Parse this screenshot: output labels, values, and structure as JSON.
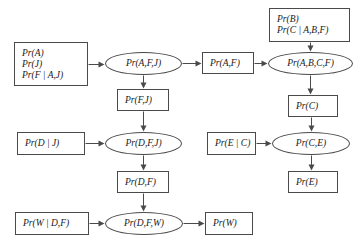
{
  "diagram": {
    "type": "flow-diagram",
    "stroke_color": "#4a4a4a",
    "text_color": "#1a1a1a",
    "background": "#ffffff",
    "nodes": [
      {
        "id": "n_prior_afj",
        "shape": "box",
        "lines": [
          "Pr(A)",
          "Pr(J)",
          "Pr(F | A,J)"
        ],
        "x": 14,
        "y": 42,
        "w": 74,
        "h": 44
      },
      {
        "id": "n_afj",
        "shape": "ellipse",
        "lines": [
          "Pr(A,F,J)"
        ],
        "x": 105,
        "y": 52,
        "w": 77,
        "h": 23
      },
      {
        "id": "n_fj",
        "shape": "box",
        "lines": [
          "Pr(F,J)"
        ],
        "x": 117,
        "y": 89,
        "w": 52,
        "h": 22
      },
      {
        "id": "n_af",
        "shape": "box",
        "lines": [
          "Pr(A,F)"
        ],
        "x": 202,
        "y": 52,
        "w": 52,
        "h": 22
      },
      {
        "id": "n_prior_b",
        "shape": "box",
        "lines": [
          "Pr(B)",
          "Pr(C | A,B,F)"
        ],
        "x": 269,
        "y": 8,
        "w": 81,
        "h": 34
      },
      {
        "id": "n_abcf",
        "shape": "ellipse",
        "lines": [
          "Pr(A,B,C,F)"
        ],
        "x": 268,
        "y": 52,
        "w": 85,
        "h": 23
      },
      {
        "id": "n_c",
        "shape": "box",
        "lines": [
          "Pr(C)"
        ],
        "x": 288,
        "y": 95,
        "w": 50,
        "h": 22
      },
      {
        "id": "n_prior_dj",
        "shape": "box",
        "lines": [
          "Pr(D | J)"
        ],
        "x": 17,
        "y": 132,
        "w": 68,
        "h": 23
      },
      {
        "id": "n_dfj",
        "shape": "ellipse",
        "lines": [
          "Pr(D,F,J)"
        ],
        "x": 105,
        "y": 132,
        "w": 77,
        "h": 23
      },
      {
        "id": "n_prior_ec",
        "shape": "box",
        "lines": [
          "Pr(E | C)"
        ],
        "x": 207,
        "y": 132,
        "w": 49,
        "h": 23
      },
      {
        "id": "n_ce",
        "shape": "ellipse",
        "lines": [
          "Pr(C,E)"
        ],
        "x": 272,
        "y": 132,
        "w": 78,
        "h": 23
      },
      {
        "id": "n_df",
        "shape": "box",
        "lines": [
          "Pr(D,F)"
        ],
        "x": 117,
        "y": 171,
        "w": 52,
        "h": 22
      },
      {
        "id": "n_e",
        "shape": "box",
        "lines": [
          "Pr(E)"
        ],
        "x": 288,
        "y": 171,
        "w": 50,
        "h": 22
      },
      {
        "id": "n_prior_wdf",
        "shape": "box",
        "lines": [
          "Pr(W | D,F)"
        ],
        "x": 15,
        "y": 212,
        "w": 74,
        "h": 23
      },
      {
        "id": "n_dfw",
        "shape": "ellipse",
        "lines": [
          "Pr(D,F,W)"
        ],
        "x": 105,
        "y": 212,
        "w": 78,
        "h": 23
      },
      {
        "id": "n_w",
        "shape": "box",
        "lines": [
          "Pr(W)"
        ],
        "x": 205,
        "y": 212,
        "w": 48,
        "h": 23
      }
    ],
    "edges": [
      {
        "from": "n_prior_afj",
        "to": "n_afj",
        "x1": 88,
        "y1": 64,
        "x2": 104,
        "y2": 64,
        "dir": "right"
      },
      {
        "from": "n_afj",
        "to": "n_fj",
        "x1": 143,
        "y1": 75,
        "x2": 143,
        "y2": 88,
        "dir": "down"
      },
      {
        "from": "n_afj",
        "to": "n_af",
        "x1": 182,
        "y1": 63,
        "x2": 201,
        "y2": 63,
        "dir": "right"
      },
      {
        "from": "n_af",
        "to": "n_abcf",
        "x1": 254,
        "y1": 63,
        "x2": 267,
        "y2": 63,
        "dir": "right"
      },
      {
        "from": "n_prior_b",
        "to": "n_abcf",
        "x1": 310,
        "y1": 42,
        "x2": 310,
        "y2": 51,
        "dir": "down"
      },
      {
        "from": "n_abcf",
        "to": "n_c",
        "x1": 310,
        "y1": 75,
        "x2": 310,
        "y2": 94,
        "dir": "down"
      },
      {
        "from": "n_fj",
        "to": "n_dfj",
        "x1": 143,
        "y1": 111,
        "x2": 143,
        "y2": 131,
        "dir": "down"
      },
      {
        "from": "n_prior_dj",
        "to": "n_dfj",
        "x1": 85,
        "y1": 143,
        "x2": 104,
        "y2": 143,
        "dir": "right"
      },
      {
        "from": "n_c",
        "to": "n_ce",
        "x1": 311,
        "y1": 117,
        "x2": 311,
        "y2": 131,
        "dir": "down"
      },
      {
        "from": "n_prior_ec",
        "to": "n_ce",
        "x1": 256,
        "y1": 143,
        "x2": 271,
        "y2": 143,
        "dir": "right"
      },
      {
        "from": "n_dfj",
        "to": "n_df",
        "x1": 143,
        "y1": 155,
        "x2": 143,
        "y2": 170,
        "dir": "down"
      },
      {
        "from": "n_ce",
        "to": "n_e",
        "x1": 311,
        "y1": 155,
        "x2": 311,
        "y2": 170,
        "dir": "down"
      },
      {
        "from": "n_df",
        "to": "n_dfw",
        "x1": 143,
        "y1": 193,
        "x2": 143,
        "y2": 211,
        "dir": "down"
      },
      {
        "from": "n_prior_wdf",
        "to": "n_dfw",
        "x1": 89,
        "y1": 223,
        "x2": 104,
        "y2": 223,
        "dir": "right"
      },
      {
        "from": "n_dfw",
        "to": "n_w",
        "x1": 183,
        "y1": 223,
        "x2": 204,
        "y2": 223,
        "dir": "right"
      }
    ]
  }
}
